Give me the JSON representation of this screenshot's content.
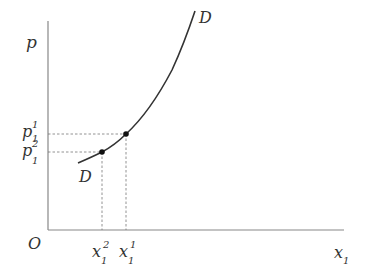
{
  "diagram": {
    "type": "demand-curve",
    "axes": {
      "y_label": "p",
      "x_label_base": "x",
      "x_label_sub": "1",
      "origin": "O"
    },
    "curve": {
      "label_top": "D",
      "label_bottom": "D"
    },
    "points": [
      {
        "name": "point-1",
        "p_base": "p",
        "p_sub": "1",
        "p_sup": "1",
        "x_base": "x",
        "x_sub": "1",
        "x_sup": "1"
      },
      {
        "name": "point-2",
        "p_base": "p",
        "p_sub": "1",
        "p_sup": "2",
        "x_base": "x",
        "x_sub": "1",
        "x_sup": "2"
      }
    ],
    "colors": {
      "axis": "#888888",
      "curve": "#333333",
      "dashed": "#777777",
      "text": "#333333"
    }
  }
}
